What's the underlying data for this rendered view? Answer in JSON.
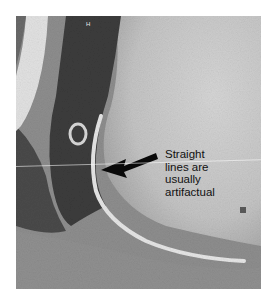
{
  "figure": {
    "annotation": "Straight\nlines are\nusually\nartifactual",
    "marker_label": "H",
    "arrow": {
      "direction": "left-down",
      "color": "#0a0a0a"
    },
    "colors": {
      "background": "#ffffff",
      "bright_tissue": "#cfcfcf",
      "dark_region": "#3a3a3a",
      "mid_gray": "#8c8c8c"
    }
  }
}
